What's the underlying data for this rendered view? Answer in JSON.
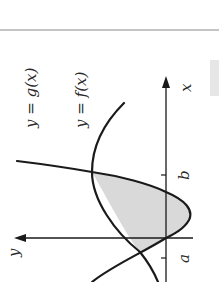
{
  "diagram": {
    "rotation_deg": 90,
    "curves": [
      {
        "id": "g",
        "label": "y = g(x)",
        "label_func": "g(x)"
      },
      {
        "id": "f",
        "label": "y = f(x)",
        "label_func": "f(x)"
      }
    ],
    "axes": {
      "x_label": "x",
      "y_label": "y"
    },
    "ticks": [
      {
        "label": "a"
      },
      {
        "label": "b"
      }
    ],
    "shaded_region": {
      "description": "Region enclosed between f(x) and g(x)",
      "fill": "#d9d9d9"
    },
    "colors": {
      "stroke": "#1a1a1a",
      "shade": "#d9d9d9",
      "rule": "#8a8a8a",
      "side_tab": "#e6e6e6"
    }
  }
}
